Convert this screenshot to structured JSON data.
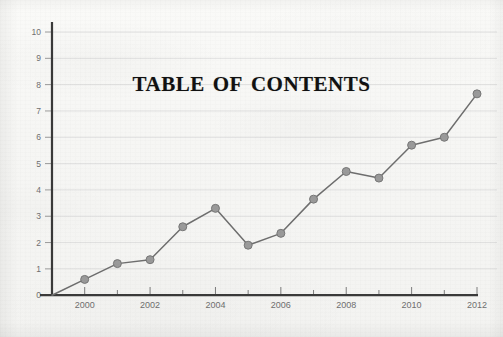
{
  "title": "Table of Contents",
  "colors": {
    "background": "#f7f7f5",
    "axis": "#3a3a3a",
    "gridline": "#dcdcdc",
    "line": "#6e6e6e",
    "marker_fill": "#9a9a9a",
    "marker_stroke": "#777777",
    "tick_text": "#6f6f6f",
    "title_text": "#111111"
  },
  "chart_data": {
    "type": "line",
    "title": "Table of Contents",
    "xlabel": "",
    "ylabel": "",
    "x": [
      1999,
      2000,
      2001,
      2002,
      2003,
      2004,
      2005,
      2006,
      2007,
      2008,
      2009,
      2010,
      2011,
      2012
    ],
    "values": [
      0,
      0.6,
      1.2,
      1.35,
      2.6,
      3.3,
      1.9,
      2.35,
      3.65,
      4.7,
      4.45,
      5.7,
      6.0,
      7.65
    ],
    "series": [
      {
        "name": "series-1",
        "values": [
          0,
          0.6,
          1.2,
          1.35,
          2.6,
          3.3,
          1.9,
          2.35,
          3.65,
          4.7,
          4.45,
          5.7,
          6.0,
          7.65
        ]
      }
    ],
    "xlim": [
      1999,
      2012
    ],
    "ylim": [
      0,
      10
    ],
    "y_ticks": [
      0,
      1,
      2,
      3,
      4,
      5,
      6,
      7,
      8,
      9,
      10
    ],
    "y_tick_labels": [
      "0",
      "1",
      "2",
      "3",
      "4",
      "5",
      "6",
      "7",
      "8",
      "9",
      "10"
    ],
    "x_ticks": [
      2000,
      2001,
      2002,
      2003,
      2004,
      2005,
      2006,
      2007,
      2008,
      2009,
      2010,
      2011,
      2012
    ],
    "x_tick_labels_major": [
      "2000",
      "2002",
      "2004",
      "2006",
      "2008",
      "2010",
      "2012"
    ],
    "x_major_years": [
      2000,
      2002,
      2004,
      2006,
      2008,
      2010,
      2012
    ],
    "x_minor_years": [
      2001,
      2003,
      2005,
      2007,
      2009,
      2011
    ],
    "grid": true,
    "grid_axis": "y",
    "legend": false,
    "markers": "circle"
  }
}
